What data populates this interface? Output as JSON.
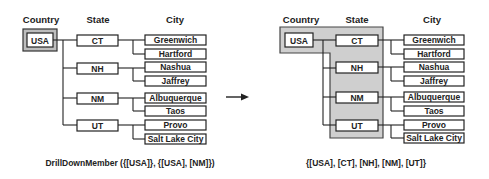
{
  "left": {
    "headers": {
      "country": "Country",
      "state": "State",
      "city": "City"
    },
    "country": "USA",
    "states": [
      {
        "label": "CT",
        "cities": [
          "Greenwich",
          "Hartford"
        ]
      },
      {
        "label": "NH",
        "cities": [
          "Nashua",
          "Jaffrey"
        ]
      },
      {
        "label": "NM",
        "cities": [
          "Albuquerque",
          "Taos"
        ]
      },
      {
        "label": "UT",
        "cities": [
          "Provo",
          "Salt Lake City"
        ]
      }
    ],
    "caption": "DrillDownMember ({[USA]}, {[USA], [NM]})"
  },
  "right": {
    "headers": {
      "country": "Country",
      "state": "State",
      "city": "City"
    },
    "country": "USA",
    "states": [
      {
        "label": "CT",
        "cities": [
          "Greenwich",
          "Hartford"
        ]
      },
      {
        "label": "NH",
        "cities": [
          "Nashua",
          "Jaffrey"
        ]
      },
      {
        "label": "NM",
        "cities": [
          "Albuquerque",
          "Taos"
        ]
      },
      {
        "label": "UT",
        "cities": [
          "Provo",
          "Salt Lake City"
        ]
      }
    ],
    "caption": "{[USA], [CT], [NH], [NM], [UT]}"
  },
  "arrow": "right-arrow",
  "colors": {
    "shade": "#cfcfcf",
    "line": "#222222"
  }
}
